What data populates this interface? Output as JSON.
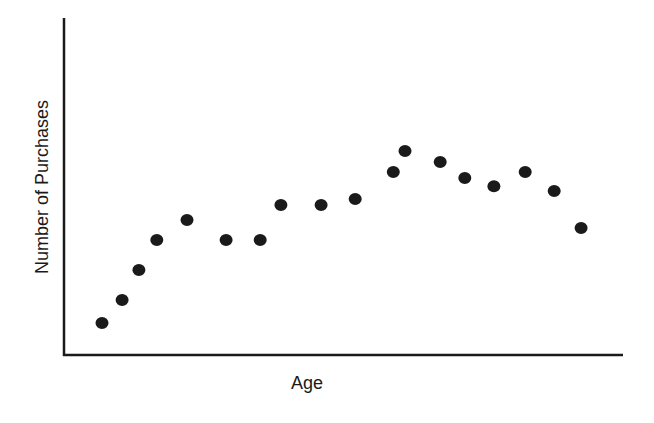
{
  "chart_data": {
    "type": "scatter",
    "title": "",
    "xlabel": "Age",
    "ylabel": "Number of Purchases",
    "xlim": [
      0,
      100
    ],
    "ylim": [
      0,
      100
    ],
    "grid": false,
    "legend": null,
    "ticks_shown": false,
    "note": "No tick labels shown; values are relative positions (0-100) within the plot area",
    "series": [
      {
        "name": "purchases",
        "color": "#1a1a1a",
        "x": [
          6.8,
          10.4,
          13.4,
          16.6,
          22.0,
          29.0,
          35.1,
          38.8,
          46.0,
          52.1,
          58.9,
          61.0,
          67.3,
          71.7,
          76.9,
          82.5,
          87.7,
          92.5
        ],
        "y": [
          9.5,
          16.3,
          25.2,
          34.1,
          40.1,
          34.1,
          34.1,
          44.5,
          44.5,
          46.3,
          54.3,
          60.5,
          57.3,
          52.5,
          50.1,
          54.3,
          48.7,
          37.7
        ]
      }
    ]
  },
  "labels": {
    "x_axis": "Age",
    "y_axis": "Number of Purchases"
  }
}
